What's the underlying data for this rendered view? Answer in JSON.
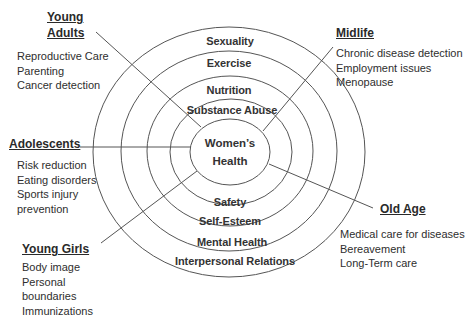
{
  "diagram": {
    "center": {
      "line1": "Women’s",
      "line2": "Health"
    },
    "rings_top": [
      {
        "label": "Sexuality"
      },
      {
        "label": "Exercise"
      },
      {
        "label": "Nutrition"
      },
      {
        "label": "Substance Abuse"
      }
    ],
    "rings_bottom": [
      {
        "label": "Safety"
      },
      {
        "label": "Self-Esteem"
      },
      {
        "label": "Mental Health"
      },
      {
        "label": "Interpersonal Relations"
      }
    ],
    "life_stages": {
      "young_adults": {
        "title_line1": "Young",
        "title_line2": "Adults",
        "items": [
          "Reproductive Care",
          "Parenting",
          "Cancer detection"
        ]
      },
      "midlife": {
        "title": "Midlife",
        "items": [
          "Chronic disease detection",
          "Employment issues",
          "Menopause"
        ]
      },
      "adolescents": {
        "title": "Adolescents",
        "items": [
          "Risk reduction",
          "Eating disorders",
          "Sports injury",
          "prevention"
        ]
      },
      "old_age": {
        "title": "Old Age",
        "items": [
          "Medical care for diseases",
          "Bereavement",
          "Long-Term care"
        ]
      },
      "young_girls": {
        "title": "Young Girls",
        "items": [
          "Body image",
          "Personal",
          "boundaries",
          "Immunizations"
        ]
      }
    },
    "colors": {
      "line": "#555555",
      "text": "#2e2e2e",
      "background": "#ffffff"
    }
  }
}
